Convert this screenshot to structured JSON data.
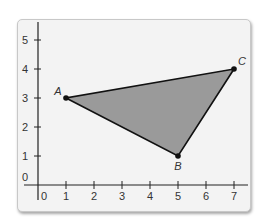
{
  "diagram": {
    "type": "coordinate-plane-triangle",
    "x_ticks": [
      "0",
      "1",
      "2",
      "3",
      "4",
      "5",
      "6",
      "7"
    ],
    "y_ticks": [
      "0",
      "1",
      "2",
      "3",
      "4",
      "5"
    ],
    "points": [
      {
        "label": "A",
        "x": 1,
        "y": 3
      },
      {
        "label": "B",
        "x": 5,
        "y": 1
      },
      {
        "label": "C",
        "x": 7,
        "y": 4
      }
    ],
    "fill_color": "#9a9a9a",
    "edge_color": "#111111"
  }
}
